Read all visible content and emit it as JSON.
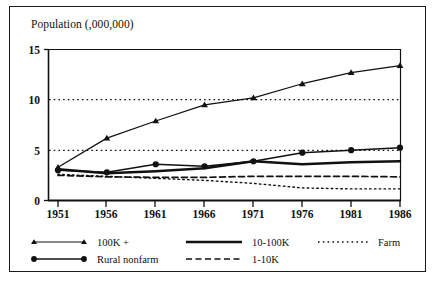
{
  "chart_data": {
    "type": "line",
    "title": "Population (,000,000)",
    "xlabel": "",
    "ylabel": "",
    "x": [
      1951,
      1956,
      1961,
      1966,
      1971,
      1976,
      1981,
      1986
    ],
    "categories": [
      "1951",
      "1956",
      "1961",
      "1966",
      "1971",
      "1976",
      "1981",
      "1986"
    ],
    "xlim": [
      1951,
      1986
    ],
    "ylim": [
      0,
      15
    ],
    "yticks": [
      0,
      5,
      10,
      15
    ],
    "ytick_labels": [
      "0",
      "5",
      "10",
      "15"
    ],
    "grid": "horizontal dotted at 5 and 10",
    "legend_position": "below-axes",
    "series": [
      {
        "name": "100K +",
        "style": "solid-with-triangle-markers",
        "marker": "triangle",
        "values": [
          3.3,
          6.2,
          7.9,
          9.5,
          10.2,
          11.6,
          12.7,
          13.4
        ]
      },
      {
        "name": "Rural nonfarm",
        "style": "solid-with-circle-markers",
        "marker": "circle",
        "values": [
          3.0,
          2.8,
          3.6,
          3.4,
          3.9,
          4.75,
          5.0,
          5.25
        ]
      },
      {
        "name": "10-100K",
        "style": "solid-thick",
        "marker": "none",
        "values": [
          3.1,
          2.7,
          2.9,
          3.2,
          3.9,
          3.6,
          3.8,
          3.9
        ]
      },
      {
        "name": "1-10K",
        "style": "dashed",
        "marker": "none",
        "values": [
          2.5,
          2.35,
          2.3,
          2.3,
          2.4,
          2.4,
          2.4,
          2.35
        ]
      },
      {
        "name": "Farm",
        "style": "dotted",
        "marker": "none",
        "values": [
          2.6,
          2.4,
          2.2,
          2.0,
          1.7,
          1.25,
          1.15,
          1.15
        ]
      }
    ]
  },
  "legend": {
    "entries": [
      {
        "label": "100K +",
        "style": "solid-with-triangle-markers"
      },
      {
        "label": "Rural nonfarm",
        "style": "solid-with-circle-markers"
      },
      {
        "label": "10-100K",
        "style": "solid-thick"
      },
      {
        "label": "1-10K",
        "style": "dashed"
      },
      {
        "label": "Farm",
        "style": "dotted"
      }
    ]
  },
  "colors": {
    "ink": "#111111",
    "frame": "#1a1a1a",
    "background": "#ffffff"
  }
}
